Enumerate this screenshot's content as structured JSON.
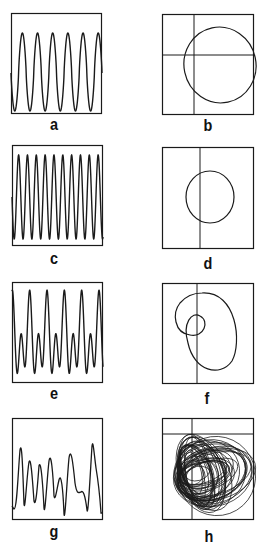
{
  "figure": {
    "ink_color": "#1a1a1a",
    "background": "#ffffff",
    "panels": [
      {
        "id": "a",
        "label": "a",
        "kind": "time-series",
        "description": "periodic oscillation, 6 peaks, large amplitude"
      },
      {
        "id": "b",
        "label": "b",
        "kind": "phase-portrait",
        "description": "single closed orbit (limit cycle), large"
      },
      {
        "id": "c",
        "label": "c",
        "kind": "time-series",
        "description": "periodic oscillation, higher frequency, ~10 peaks"
      },
      {
        "id": "d",
        "label": "d",
        "kind": "phase-portrait",
        "description": "single closed orbit, smaller"
      },
      {
        "id": "e",
        "label": "e",
        "kind": "time-series",
        "description": "period-2 oscillation, alternating large/small peaks"
      },
      {
        "id": "f",
        "label": "f",
        "kind": "phase-portrait",
        "description": "double-loop closed orbit (period 2)"
      },
      {
        "id": "g",
        "label": "g",
        "kind": "time-series",
        "description": "irregular (chaotic) oscillation"
      },
      {
        "id": "h",
        "label": "h",
        "kind": "phase-portrait",
        "description": "chaotic attractor, many overlapping loops"
      }
    ]
  },
  "chart_data": [
    {
      "type": "line",
      "panel": "a",
      "title": "",
      "xlabel": "",
      "ylabel": "",
      "peaks": 6,
      "grid": false
    },
    {
      "type": "line",
      "panel": "b",
      "title": "",
      "xlabel": "",
      "ylabel": "",
      "axes_crosshair": true,
      "shape": "ellipse"
    },
    {
      "type": "line",
      "panel": "c",
      "title": "",
      "xlabel": "",
      "ylabel": "",
      "peaks": 10,
      "grid": false
    },
    {
      "type": "line",
      "panel": "d",
      "title": "",
      "xlabel": "",
      "ylabel": "",
      "axes_crosshair": "vertical-only",
      "shape": "ellipse"
    },
    {
      "type": "line",
      "panel": "e",
      "title": "",
      "xlabel": "",
      "ylabel": "",
      "large_peaks": 5,
      "small_peaks": 5,
      "grid": false
    },
    {
      "type": "line",
      "panel": "f",
      "title": "",
      "xlabel": "",
      "ylabel": "",
      "axes_crosshair": "vertical-only",
      "shape": "double-loop"
    },
    {
      "type": "line",
      "panel": "g",
      "title": "",
      "xlabel": "",
      "ylabel": "",
      "behavior": "chaotic",
      "grid": false
    },
    {
      "type": "line",
      "panel": "h",
      "title": "",
      "xlabel": "",
      "ylabel": "",
      "axes_crosshair": true,
      "shape": "strange-attractor"
    }
  ]
}
